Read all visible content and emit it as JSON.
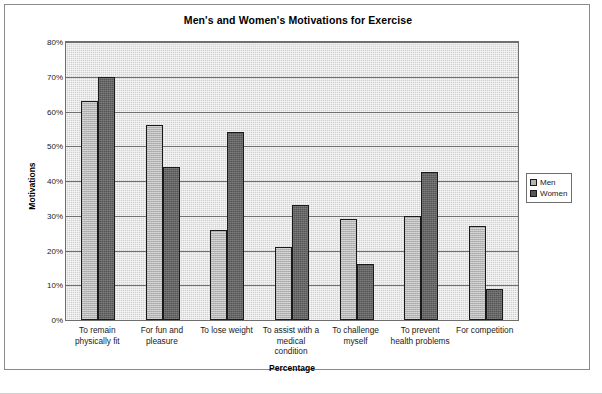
{
  "chart_data": {
    "type": "bar",
    "title": "Men's and Women's Motivations for Exercise",
    "xlabel": "Percentage",
    "ylabel": "Motivations",
    "ylim": [
      0,
      80
    ],
    "ytick_labels": [
      "80%",
      "70%",
      "60%",
      "50%",
      "40%",
      "30%",
      "20%",
      "10%",
      "0%"
    ],
    "ytick_values": [
      80,
      70,
      60,
      50,
      40,
      30,
      20,
      10,
      0
    ],
    "grid": true,
    "legend_position": "right",
    "categories": [
      "To remain physically fit",
      "For fun and pleasure",
      "To lose weight",
      "To assist with a medical condition",
      "To challenge myself",
      "To prevent health problems",
      "For competition"
    ],
    "category_lines": [
      [
        "To remain",
        "physically fit"
      ],
      [
        "For fun and",
        "pleasure"
      ],
      [
        "To lose weight"
      ],
      [
        "To assist with a",
        "medical",
        "condition"
      ],
      [
        "To challenge",
        "myself"
      ],
      [
        "To prevent",
        "health problems"
      ],
      [
        "For competition"
      ]
    ],
    "series": [
      {
        "name": "Men",
        "color": "#b4b4b4",
        "values": [
          63,
          56,
          26,
          21,
          29,
          30,
          27
        ]
      },
      {
        "name": "Women",
        "color": "#555555",
        "values": [
          70,
          44,
          54,
          33,
          16,
          42.5,
          9
        ]
      }
    ]
  },
  "legend": {
    "items": [
      {
        "label": "Men"
      },
      {
        "label": "Women"
      }
    ]
  }
}
